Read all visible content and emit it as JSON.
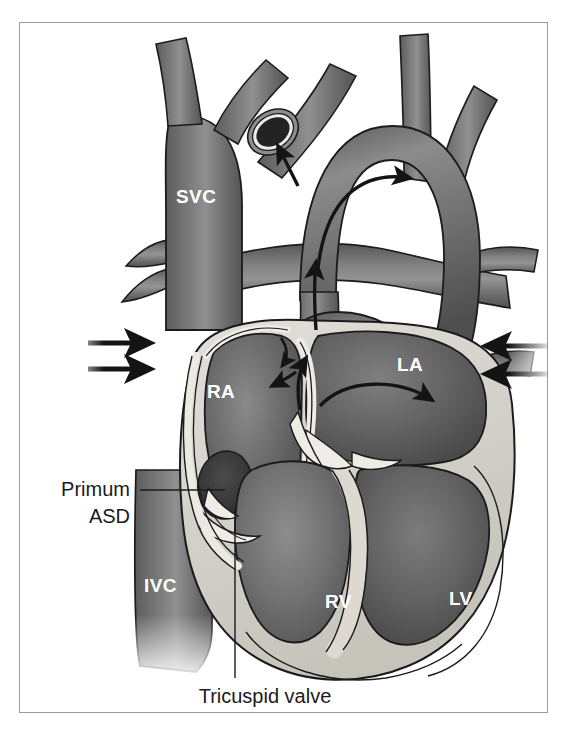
{
  "figure": {
    "frame": {
      "border_color": "#9a9a9a",
      "background": "#ffffff"
    }
  },
  "colors": {
    "background": "#ffffff",
    "border": "#9a9a9a",
    "vessel_dark": "#6e6e6e",
    "vessel_mid": "#7d7d7d",
    "vessel_light": "#9a9a9a",
    "chamber_blood": "#6a6a6a",
    "chamber_blood_dark": "#5a5a5a",
    "myocardium": "#d6d3cc",
    "endocardium": "#e8e6e0",
    "outline": "#1b1b1b",
    "defect_dark": "#3a3a3a",
    "label_white": "#ffffff",
    "label_black": "#1b1b1b",
    "arrow": "#141414"
  },
  "chamber_labels": [
    {
      "id": "svc",
      "text": "SVC",
      "x": 176,
      "y": 203
    },
    {
      "id": "ra",
      "text": "RA",
      "x": 207,
      "y": 398
    },
    {
      "id": "la",
      "text": "LA",
      "x": 397,
      "y": 371
    },
    {
      "id": "ivc",
      "text": "IVC",
      "x": 144,
      "y": 592
    },
    {
      "id": "rv",
      "text": "RV",
      "x": 325,
      "y": 608
    },
    {
      "id": "lv",
      "text": "LV",
      "x": 449,
      "y": 605
    }
  ],
  "callouts": [
    {
      "id": "primum-asd",
      "lines": [
        "Primum",
        "ASD"
      ],
      "text": "Primum ASD",
      "text_anchor": "end",
      "line1_x": 130,
      "line1_y": 496,
      "line2_x": 130,
      "line2_y": 523,
      "leader": {
        "x1": 140,
        "y1": 490,
        "x2": 225,
        "y2": 490
      }
    },
    {
      "id": "tricuspid-valve",
      "lines": [
        "Tricuspid valve"
      ],
      "text": "Tricuspid valve",
      "text_anchor": "middle",
      "line1_x": 265,
      "line1_y": 703,
      "leader": {
        "x1": 235,
        "y1": 510,
        "x2": 235,
        "y2": 678
      }
    }
  ],
  "flow_arrows": [
    {
      "id": "svc-inflow-upper",
      "direction": "right",
      "x": 98,
      "y": 342,
      "length": 56,
      "description": "systemic venous return entering right atrium"
    },
    {
      "id": "ivc-inflow-lower",
      "direction": "right",
      "x": 98,
      "y": 368,
      "length": 56,
      "description": "systemic venous return entering right atrium"
    },
    {
      "id": "pulmvein-inflow-upper",
      "direction": "left",
      "x": 548,
      "y": 345,
      "length": 58,
      "description": "pulmonary venous return entering left atrium"
    },
    {
      "id": "pulmvein-inflow-lower",
      "direction": "left",
      "x": 548,
      "y": 372,
      "length": 58,
      "description": "pulmonary venous return entering left atrium"
    },
    {
      "id": "aortic-arch-flow",
      "direction": "curved-right",
      "description": "blood flow around the aortic arch"
    },
    {
      "id": "ascending-aorta-flow",
      "direction": "up",
      "description": "blood flow up the ascending aorta"
    },
    {
      "id": "pulmonary-artery-flow",
      "direction": "curved-right",
      "description": "blood flow into the pulmonary artery"
    },
    {
      "id": "pulmonary-trunk-flow",
      "direction": "up",
      "description": "blood flow into the pulmonary trunk"
    },
    {
      "id": "brachiocephalic-flow",
      "direction": "up-left",
      "description": "blood flow up the brachiocephalic vessel"
    },
    {
      "id": "shunt-flow",
      "direction": "up-left",
      "description": "shunt flow across the primum defect into the right atrium"
    }
  ],
  "anatomy": [
    {
      "id": "superior-vena-cava",
      "label": "SVC"
    },
    {
      "id": "inferior-vena-cava",
      "label": "IVC"
    },
    {
      "id": "right-atrium",
      "label": "RA"
    },
    {
      "id": "left-atrium",
      "label": "LA"
    },
    {
      "id": "right-ventricle",
      "label": "RV"
    },
    {
      "id": "left-ventricle",
      "label": "LV"
    },
    {
      "id": "aortic-arch",
      "label": ""
    },
    {
      "id": "pulmonary-artery",
      "label": ""
    },
    {
      "id": "primum-atrial-septal-defect",
      "label": "Primum ASD"
    },
    {
      "id": "tricuspid-valve",
      "label": "Tricuspid valve"
    },
    {
      "id": "interventricular-septum",
      "label": ""
    },
    {
      "id": "cut-vessel-stump",
      "label": ""
    }
  ]
}
